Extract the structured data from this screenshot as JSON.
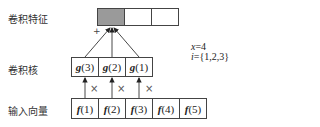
{
  "labels": {
    "feature": "卷积特征",
    "kernel": "卷积核",
    "input": "输入向量"
  },
  "feature_cells": [
    "",
    "",
    ""
  ],
  "feature_highlight_color": "#9a9a9a",
  "kernel_cells": [
    {
      "fn": "g",
      "arg": "(3)"
    },
    {
      "fn": "g",
      "arg": "(2)"
    },
    {
      "fn": "g",
      "arg": "(1)"
    }
  ],
  "input_cells": [
    {
      "fn": "f",
      "arg": "(1)"
    },
    {
      "fn": "f",
      "arg": "(2)"
    },
    {
      "fn": "f",
      "arg": "(3)"
    },
    {
      "fn": "f",
      "arg": "(4)"
    },
    {
      "fn": "f",
      "arg": "(5)"
    }
  ],
  "operators": {
    "multiply": "×",
    "sum": "+"
  },
  "annotation": {
    "line1_var": "x",
    "line1_val": "=4",
    "line2_var": "i",
    "line2_val": "={1,2,3}"
  }
}
